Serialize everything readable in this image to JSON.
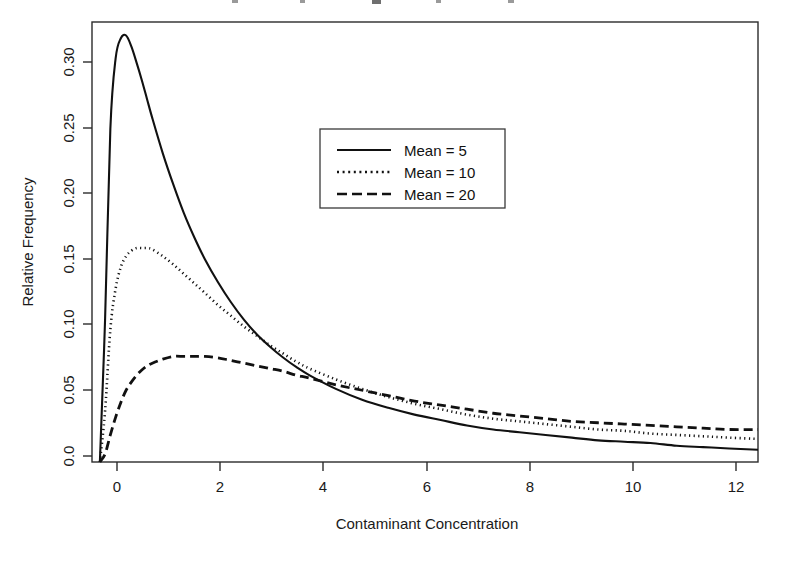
{
  "chart_data": {
    "type": "line",
    "title": "",
    "title_visible": false,
    "xlabel": "Contaminant Concentration",
    "ylabel": "Relative Frequency",
    "xlim": [
      -0.15,
      12.55
    ],
    "ylim": [
      0.0,
      0.325
    ],
    "xticks": [
      0,
      2,
      4,
      6,
      8,
      10,
      12
    ],
    "xtick_labels": [
      "0",
      "2",
      "4",
      "6",
      "8",
      "10",
      "12"
    ],
    "yticks": [
      0.0,
      0.05,
      0.1,
      0.15,
      0.2,
      0.25,
      0.3
    ],
    "ytick_labels": [
      "0.0",
      "0.05",
      "0.10",
      "0.15",
      "0.20",
      "0.25",
      "0.30"
    ],
    "grid": false,
    "legend_position": "upper-center",
    "line_color": "#111111",
    "frame_color": "#2b2b2b",
    "series": [
      {
        "name": "Mean = 5",
        "style": "solid",
        "peak_x": 0.5,
        "peak_y": 0.315,
        "x": [
          0.0,
          0.1,
          0.2,
          0.3,
          0.4,
          0.5,
          0.6,
          0.7,
          0.8,
          0.9,
          1.0,
          1.2,
          1.4,
          1.6,
          1.8,
          2.0,
          2.25,
          2.5,
          2.75,
          3.0,
          3.25,
          3.5,
          3.75,
          4.0,
          4.5,
          5.0,
          5.5,
          6.0,
          6.5,
          7.0,
          7.5,
          8.0,
          8.5,
          9.0,
          9.5,
          10.0,
          10.5,
          11.0,
          11.5,
          12.0,
          12.55
        ],
        "values": [
          0.0,
          0.106,
          0.246,
          0.298,
          0.313,
          0.315,
          0.307,
          0.295,
          0.282,
          0.268,
          0.254,
          0.228,
          0.205,
          0.184,
          0.166,
          0.15,
          0.133,
          0.118,
          0.105,
          0.094,
          0.085,
          0.077,
          0.07,
          0.064,
          0.054,
          0.046,
          0.04,
          0.035,
          0.031,
          0.027,
          0.024,
          0.022,
          0.02,
          0.018,
          0.016,
          0.015,
          0.014,
          0.012,
          0.011,
          0.01,
          0.009
        ]
      },
      {
        "name": "Mean = 10",
        "style": "dotted",
        "peak_x": 0.95,
        "peak_y": 0.158,
        "x": [
          0.0,
          0.1,
          0.2,
          0.3,
          0.4,
          0.5,
          0.6,
          0.7,
          0.8,
          0.9,
          1.0,
          1.2,
          1.4,
          1.6,
          1.8,
          2.0,
          2.25,
          2.5,
          2.75,
          3.0,
          3.25,
          3.5,
          3.75,
          4.0,
          4.5,
          5.0,
          5.5,
          6.0,
          6.5,
          7.0,
          7.5,
          8.0,
          8.5,
          9.0,
          9.5,
          10.0,
          10.5,
          11.0,
          11.5,
          12.0,
          12.55
        ],
        "values": [
          0.0,
          0.038,
          0.098,
          0.128,
          0.144,
          0.152,
          0.156,
          0.158,
          0.158,
          0.158,
          0.157,
          0.152,
          0.146,
          0.139,
          0.132,
          0.125,
          0.116,
          0.108,
          0.1,
          0.093,
          0.086,
          0.08,
          0.074,
          0.069,
          0.061,
          0.054,
          0.048,
          0.043,
          0.039,
          0.035,
          0.032,
          0.03,
          0.028,
          0.026,
          0.024,
          0.023,
          0.021,
          0.02,
          0.019,
          0.018,
          0.017
        ]
      },
      {
        "name": "Mean = 20",
        "style": "dashed",
        "peak_x": 1.8,
        "peak_y": 0.078,
        "x": [
          0.0,
          0.1,
          0.2,
          0.3,
          0.4,
          0.5,
          0.6,
          0.7,
          0.8,
          0.9,
          1.0,
          1.2,
          1.4,
          1.6,
          1.8,
          2.0,
          2.25,
          2.5,
          2.75,
          3.0,
          3.25,
          3.5,
          3.75,
          4.0,
          4.5,
          5.0,
          5.5,
          6.0,
          6.5,
          7.0,
          7.5,
          8.0,
          8.5,
          9.0,
          9.5,
          10.0,
          10.5,
          11.0,
          11.5,
          12.0,
          12.55
        ],
        "values": [
          0.0,
          0.006,
          0.02,
          0.033,
          0.044,
          0.053,
          0.059,
          0.064,
          0.068,
          0.071,
          0.073,
          0.076,
          0.078,
          0.078,
          0.078,
          0.078,
          0.077,
          0.075,
          0.073,
          0.071,
          0.069,
          0.067,
          0.064,
          0.062,
          0.057,
          0.053,
          0.049,
          0.045,
          0.042,
          0.039,
          0.036,
          0.034,
          0.032,
          0.03,
          0.029,
          0.028,
          0.027,
          0.026,
          0.025,
          0.024,
          0.024
        ]
      }
    ]
  },
  "legend": {
    "entries": [
      {
        "label": "Mean =  5",
        "style": "solid"
      },
      {
        "label": "Mean = 10",
        "style": "dotted"
      },
      {
        "label": "Mean = 20",
        "style": "dashed"
      }
    ]
  },
  "axes": {
    "x_title": "Contaminant Concentration",
    "y_title": "Relative Frequency"
  }
}
